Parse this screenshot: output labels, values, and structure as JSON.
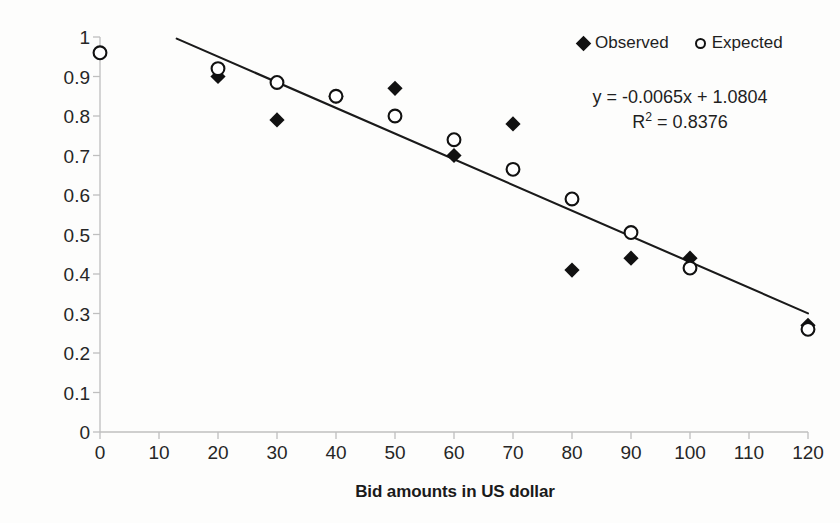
{
  "chart_data": {
    "type": "scatter",
    "title": "",
    "xlabel": "Bid amounts in US dollar",
    "ylabel": "Proportion of visitors willing to pay",
    "xlim": [
      0,
      120
    ],
    "ylim": [
      0,
      1
    ],
    "xticks": [
      0,
      10,
      20,
      30,
      40,
      50,
      60,
      70,
      80,
      90,
      100,
      110,
      120
    ],
    "yticks": [
      0,
      0.1,
      0.2,
      0.3,
      0.4,
      0.5,
      0.6,
      0.7,
      0.8,
      0.9,
      1
    ],
    "xtick_labels": [
      "0",
      "10",
      "20",
      "30",
      "40",
      "50",
      "60",
      "70",
      "80",
      "90",
      "100",
      "110",
      "120"
    ],
    "ytick_labels": [
      "0",
      "0.1",
      "0.2",
      "0.3",
      "0.4",
      "0.5",
      "0.6",
      "0.7",
      "0.8",
      "0.9",
      "1"
    ],
    "grid": false,
    "legend_position": "top-right",
    "series": [
      {
        "name": "Observed",
        "marker": "filled-diamond",
        "color": "#111111",
        "points": [
          {
            "x": 20,
            "y": 0.9
          },
          {
            "x": 30,
            "y": 0.79
          },
          {
            "x": 40,
            "y": 0.85
          },
          {
            "x": 50,
            "y": 0.87
          },
          {
            "x": 60,
            "y": 0.7
          },
          {
            "x": 70,
            "y": 0.78
          },
          {
            "x": 80,
            "y": 0.41
          },
          {
            "x": 90,
            "y": 0.44
          },
          {
            "x": 100,
            "y": 0.44
          },
          {
            "x": 120,
            "y": 0.27
          }
        ]
      },
      {
        "name": "Expected",
        "marker": "open-circle",
        "color": "#111111",
        "points": [
          {
            "x": 0,
            "y": 0.96
          },
          {
            "x": 20,
            "y": 0.92
          },
          {
            "x": 30,
            "y": 0.885
          },
          {
            "x": 40,
            "y": 0.85
          },
          {
            "x": 50,
            "y": 0.8
          },
          {
            "x": 60,
            "y": 0.74
          },
          {
            "x": 70,
            "y": 0.665
          },
          {
            "x": 80,
            "y": 0.59
          },
          {
            "x": 90,
            "y": 0.505
          },
          {
            "x": 100,
            "y": 0.415
          },
          {
            "x": 120,
            "y": 0.26
          }
        ]
      }
    ],
    "trendline": {
      "slope": -0.0065,
      "intercept": 1.0804,
      "x_start": 13,
      "x_end": 120,
      "color": "#1a1a1a"
    },
    "annotations": {
      "equation": "y = -0.0065x + 1.0804",
      "r_squared_prefix": "R",
      "r_squared_sup": "2",
      "r_squared_value": " = 0.8376"
    }
  },
  "legend": {
    "entries": [
      {
        "label": "Observed",
        "marker": "filled-diamond"
      },
      {
        "label": "Expected",
        "marker": "open-circle"
      }
    ]
  },
  "axes": {
    "x_title": "Bid amounts in US dollar",
    "y_title": "Proportion of visitors willing to pay"
  },
  "colors": {
    "marker": "#111111",
    "trendline": "#1a1a1a",
    "axis": "#bfbfbf",
    "text": "#262626",
    "background": "#fdfdfc"
  }
}
